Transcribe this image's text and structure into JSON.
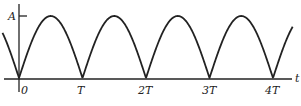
{
  "chart_data": {
    "type": "line",
    "title": "",
    "xlabel": "t",
    "ylabel": "",
    "x_tick_labels": [
      "0",
      "T",
      "2T",
      "3T",
      "4T"
    ],
    "y_tick_labels": [
      "A"
    ],
    "x": [
      0,
      0.5,
      1,
      1.5,
      2,
      2.5,
      3,
      3.5,
      4
    ],
    "x_units": "T",
    "values": [
      0,
      1,
      0,
      1,
      0,
      1,
      0,
      1,
      0
    ],
    "y_units": "A",
    "ylim": [
      0,
      1
    ],
    "grid": false,
    "legend": null
  },
  "labels": {
    "y_max": "A",
    "x_axis": "t",
    "ticks": [
      "0",
      "T",
      "2T",
      "3T",
      "4T"
    ]
  }
}
